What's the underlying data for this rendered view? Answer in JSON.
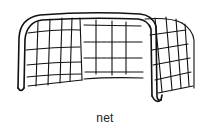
{
  "illustration": {
    "subject": "soccer-goal-net",
    "style": "black line drawing",
    "stroke_color": "#111111",
    "background": "#ffffff"
  },
  "caption": {
    "text": "net"
  }
}
